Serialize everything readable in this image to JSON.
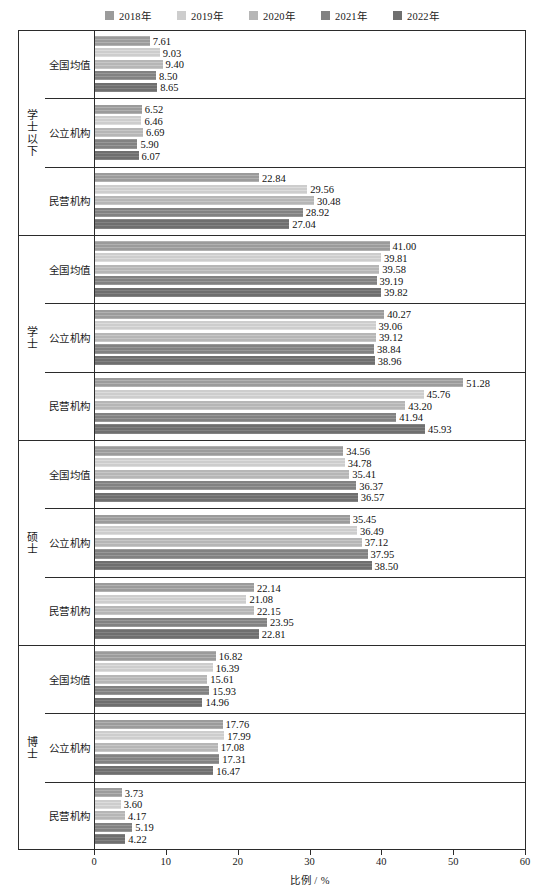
{
  "legend": {
    "position": "top-center",
    "items": [
      {
        "label": "2018年",
        "color": "#9b9b9b"
      },
      {
        "label": "2019年",
        "color": "#cdcdcd"
      },
      {
        "label": "2020年",
        "color": "#b6b6b6"
      },
      {
        "label": "2021年",
        "color": "#828282"
      },
      {
        "label": "2022年",
        "color": "#6f6f6f"
      }
    ]
  },
  "axis": {
    "xlabel": "比例 / %",
    "xticks": [
      "0",
      "10",
      "20",
      "30",
      "40",
      "50",
      "60"
    ],
    "xmin": 0,
    "xmax": 60
  },
  "chart_data": {
    "type": "bar",
    "orientation": "horizontal",
    "title": "",
    "xlabel": "比例 / %",
    "ylabel": "",
    "xlim": [
      0,
      60
    ],
    "grid": false,
    "legend_position": "top-center",
    "series": [
      {
        "name": "2018年",
        "color": "#9b9b9b"
      },
      {
        "name": "2019年",
        "color": "#cdcdcd"
      },
      {
        "name": "2020年",
        "color": "#b6b6b6"
      },
      {
        "name": "2021年",
        "color": "#828282"
      },
      {
        "name": "2022年",
        "color": "#6f6f6f"
      }
    ],
    "groups": [
      {
        "label": "学士以下",
        "rows": [
          {
            "label": "全国均值",
            "values": [
              7.61,
              9.03,
              9.4,
              8.5,
              8.65
            ]
          },
          {
            "label": "公立机构",
            "values": [
              6.52,
              6.46,
              6.69,
              5.9,
              6.07
            ]
          },
          {
            "label": "民营机构",
            "values": [
              22.84,
              29.56,
              30.48,
              28.92,
              27.04
            ]
          }
        ]
      },
      {
        "label": "学士",
        "rows": [
          {
            "label": "全国均值",
            "values": [
              41.0,
              39.81,
              39.58,
              39.19,
              39.82
            ]
          },
          {
            "label": "公立机构",
            "values": [
              40.27,
              39.06,
              39.12,
              38.84,
              38.96
            ]
          },
          {
            "label": "民营机构",
            "values": [
              51.28,
              45.76,
              43.2,
              41.94,
              45.93
            ]
          }
        ]
      },
      {
        "label": "硕士",
        "rows": [
          {
            "label": "全国均值",
            "values": [
              34.56,
              34.78,
              35.41,
              36.37,
              36.57
            ]
          },
          {
            "label": "公立机构",
            "values": [
              35.45,
              36.49,
              37.12,
              37.95,
              38.5
            ]
          },
          {
            "label": "民营机构",
            "values": [
              22.14,
              21.08,
              22.15,
              23.95,
              22.81
            ]
          }
        ]
      },
      {
        "label": "博士",
        "rows": [
          {
            "label": "全国均值",
            "values": [
              16.82,
              16.39,
              15.61,
              15.93,
              14.96
            ]
          },
          {
            "label": "公立机构",
            "values": [
              17.76,
              17.99,
              17.08,
              17.31,
              16.47
            ]
          },
          {
            "label": "民营机构",
            "values": [
              3.73,
              3.6,
              4.17,
              5.19,
              4.22
            ]
          }
        ]
      }
    ]
  }
}
